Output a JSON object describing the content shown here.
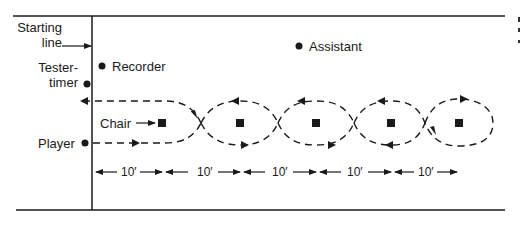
{
  "figure": {
    "labels": {
      "starting_line_1": "Starting",
      "starting_line_2": "line",
      "tester_timer_1": "Tester-",
      "tester_timer_2": "timer",
      "recorder": "Recorder",
      "assistant": "Assistant",
      "chair": "Chair",
      "player": "Player"
    },
    "dimensions": [
      "10′",
      "10′",
      "10′",
      "10′",
      "10′"
    ],
    "chair_count": 5,
    "colors": {
      "ink": "#1a1a1a",
      "background": "#ffffff"
    }
  }
}
